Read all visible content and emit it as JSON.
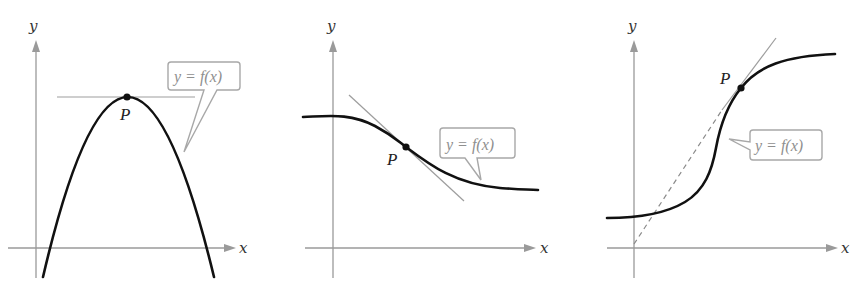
{
  "figure": {
    "panels": [
      {
        "id": "panel-1",
        "description": "Concave-down parabola with horizontal tangent line at maximum point P",
        "axis_labels": {
          "x": "x",
          "y": "y"
        },
        "point_label": "P",
        "callout": "y = f(x)",
        "tangent_type": "horizontal"
      },
      {
        "id": "panel-2",
        "description": "Decreasing curve with tangent line at inflection point P",
        "axis_labels": {
          "x": "x",
          "y": "y"
        },
        "point_label": "P",
        "callout": "y = f(x)",
        "tangent_type": "negative slope"
      },
      {
        "id": "panel-3",
        "description": "Increasing S-shaped curve with tangent line through P extended (dashed) to the origin",
        "axis_labels": {
          "x": "x",
          "y": "y"
        },
        "point_label": "P",
        "callout": "y = f(x)",
        "tangent_type": "positive slope, dashed extension to origin"
      }
    ]
  },
  "colors": {
    "axis": "#9a9a9a",
    "curve": "#111111",
    "tangent": "#9d9d9d",
    "callout_border": "#a8a8a8",
    "callout_text": "#8f8f8f"
  }
}
